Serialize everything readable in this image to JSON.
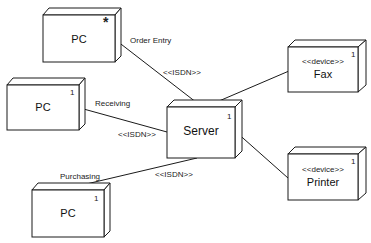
{
  "diagram": {
    "type": "UML deployment diagram",
    "nodes": [
      {
        "id": "pc_order",
        "name": "PC",
        "multiplicity": "*",
        "stereotype": ""
      },
      {
        "id": "pc_receiving",
        "name": "PC",
        "multiplicity": "1",
        "stereotype": ""
      },
      {
        "id": "pc_purchasing",
        "name": "PC",
        "multiplicity": "1",
        "stereotype": ""
      },
      {
        "id": "server",
        "name": "Server",
        "multiplicity": "1",
        "stereotype": ""
      },
      {
        "id": "fax",
        "name": "Fax",
        "multiplicity": "1",
        "stereotype": "<<device>>"
      },
      {
        "id": "printer",
        "name": "Printer",
        "multiplicity": "1",
        "stereotype": "<<device>>"
      }
    ],
    "connections": [
      {
        "from": "pc_order",
        "to": "server",
        "role": "Order Entry",
        "stereotype": "<<ISDN>>"
      },
      {
        "from": "pc_receiving",
        "to": "server",
        "role": "Receiving",
        "stereotype": "<<ISDN>>"
      },
      {
        "from": "pc_purchasing",
        "to": "server",
        "role": "Purchasing",
        "stereotype": "<<ISDN>>"
      },
      {
        "from": "server",
        "to": "fax",
        "role": "",
        "stereotype": ""
      },
      {
        "from": "server",
        "to": "printer",
        "role": "",
        "stereotype": ""
      }
    ]
  },
  "colors": {
    "line": "#1a1a1a",
    "fill": "#ffffff"
  }
}
